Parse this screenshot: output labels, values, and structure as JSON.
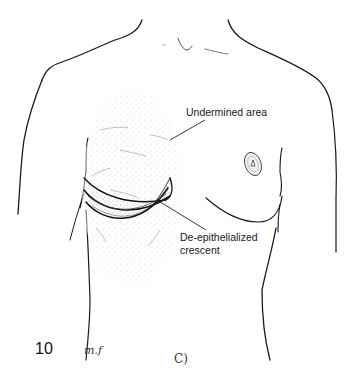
{
  "figure": {
    "number": "10",
    "signature": "m.f",
    "bottom_mark": "C)",
    "labels": {
      "undermined": "Undermined area",
      "crescent_line1": "De-epithelialized",
      "crescent_line2": "crescent"
    }
  },
  "colors": {
    "ink": "#1a1a1a",
    "stipple": "#9a9a9a",
    "background": "#ffffff"
  }
}
